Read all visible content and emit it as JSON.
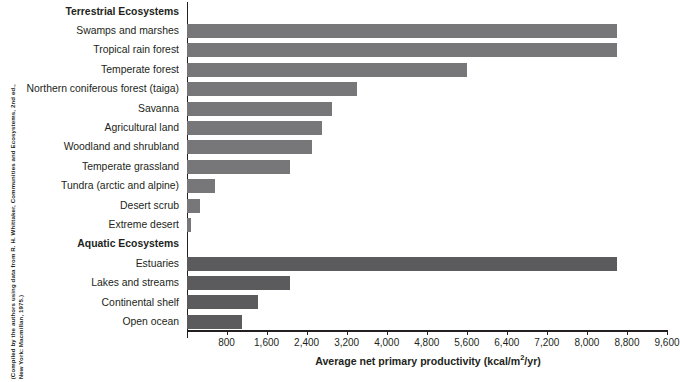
{
  "figure": {
    "source_note_lines": [
      "(Compiled by the authors using data from R. H. Whittaker, Communities and Ecosystems, 2nd ed.,",
      "New York: Macmillan, 1975.)"
    ]
  },
  "axis": {
    "title_main": "Average net primary productivity (kcal/m",
    "title_sup": "2",
    "title_tail": "/yr)",
    "tick_labels": [
      "800",
      "1,600",
      "2,400",
      "3,200",
      "4,000",
      "4,800",
      "5,600",
      "6,400",
      "7,200",
      "8,000",
      "8,800",
      "9,600"
    ]
  },
  "groups": {
    "terrestrial": "Terrestrial Ecosystems",
    "aquatic": "Aquatic Ecosystems"
  },
  "colors": {
    "terrestrial_bar": "#77777a",
    "aquatic_bar": "#5b5b5e",
    "axis": "#231f20",
    "text": "#231f20",
    "background": "#ffffff"
  },
  "chart_data": {
    "type": "bar",
    "orientation": "horizontal",
    "title": "",
    "xlabel": "Average net primary productivity (kcal/m2/yr)",
    "ylabel": "",
    "xlim": [
      0,
      9600
    ],
    "xtick_step": 800,
    "grid": false,
    "legend": "none",
    "rows": [
      {
        "label": "Terrestrial Ecosystems",
        "is_group_header": true,
        "value": null,
        "group": "terrestrial"
      },
      {
        "label": "Swamps and marshes",
        "is_group_header": false,
        "value": 8600,
        "group": "terrestrial"
      },
      {
        "label": "Tropical rain forest",
        "is_group_header": false,
        "value": 8600,
        "group": "terrestrial"
      },
      {
        "label": "Temperate forest",
        "is_group_header": false,
        "value": 5600,
        "group": "terrestrial"
      },
      {
        "label": "Northern coniferous forest (taiga)",
        "is_group_header": false,
        "value": 3400,
        "group": "terrestrial"
      },
      {
        "label": "Savanna",
        "is_group_header": false,
        "value": 2900,
        "group": "terrestrial"
      },
      {
        "label": "Agricultural land",
        "is_group_header": false,
        "value": 2700,
        "group": "terrestrial"
      },
      {
        "label": "Woodland and shrubland",
        "is_group_header": false,
        "value": 2500,
        "group": "terrestrial"
      },
      {
        "label": "Temperate grassland",
        "is_group_header": false,
        "value": 2060,
        "group": "terrestrial"
      },
      {
        "label": "Tundra (arctic and alpine)",
        "is_group_header": false,
        "value": 550,
        "group": "terrestrial"
      },
      {
        "label": "Desert scrub",
        "is_group_header": false,
        "value": 250,
        "group": "terrestrial"
      },
      {
        "label": "Extreme desert",
        "is_group_header": false,
        "value": 70,
        "group": "terrestrial"
      },
      {
        "label": "Aquatic Ecosystems",
        "is_group_header": true,
        "value": null,
        "group": "aquatic"
      },
      {
        "label": "Estuaries",
        "is_group_header": false,
        "value": 8600,
        "group": "aquatic"
      },
      {
        "label": "Lakes and streams",
        "is_group_header": false,
        "value": 2060,
        "group": "aquatic"
      },
      {
        "label": "Continental shelf",
        "is_group_header": false,
        "value": 1420,
        "group": "aquatic"
      },
      {
        "label": "Open ocean",
        "is_group_header": false,
        "value": 1100,
        "group": "aquatic"
      }
    ]
  }
}
